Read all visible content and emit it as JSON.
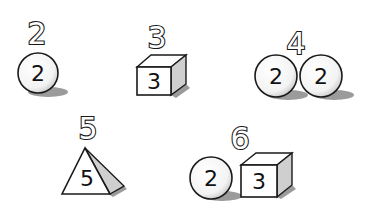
{
  "diagram": {
    "groups": [
      {
        "id": "g2",
        "total_label": "2",
        "shapes": [
          {
            "type": "sphere",
            "value": "2"
          }
        ]
      },
      {
        "id": "g3",
        "total_label": "3",
        "shapes": [
          {
            "type": "cube",
            "value": "3"
          }
        ]
      },
      {
        "id": "g4",
        "total_label": "4",
        "shapes": [
          {
            "type": "sphere",
            "value": "2"
          },
          {
            "type": "sphere",
            "value": "2"
          }
        ]
      },
      {
        "id": "g5",
        "total_label": "5",
        "shapes": [
          {
            "type": "pyramid",
            "value": "5"
          }
        ]
      },
      {
        "id": "g6",
        "total_label": "6",
        "shapes": [
          {
            "type": "sphere",
            "value": "2"
          },
          {
            "type": "cube",
            "value": "3"
          }
        ]
      }
    ]
  },
  "colors": {
    "stroke": "#1a1a1a",
    "fill": "#ffffff",
    "shade": "#cfcfcf",
    "shadow": "#7a7a7a",
    "background": "#ffffff"
  }
}
